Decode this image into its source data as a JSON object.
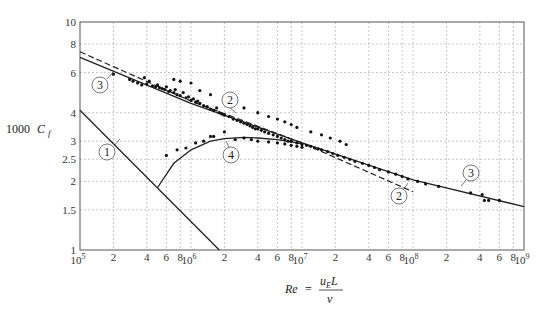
{
  "chart_data": {
    "type": "line",
    "title": "",
    "xlabel": "Re = u_E L / ν",
    "ylabel": "1000 C_f",
    "xscale": "log",
    "yscale": "log",
    "xlim": [
      100000,
      1000000000
    ],
    "ylim": [
      1,
      10
    ],
    "grid": true,
    "x_ticks": [
      {
        "value": 100000,
        "label": "10",
        "exp": "5"
      },
      {
        "value": 200000,
        "label": "2"
      },
      {
        "value": 400000,
        "label": "4"
      },
      {
        "value": 600000,
        "label": "6"
      },
      {
        "value": 800000,
        "label": "8"
      },
      {
        "value": 1000000,
        "label": "10",
        "exp": "6"
      },
      {
        "value": 2000000,
        "label": "2"
      },
      {
        "value": 4000000,
        "label": "4"
      },
      {
        "value": 6000000,
        "label": "6"
      },
      {
        "value": 8000000,
        "label": "8"
      },
      {
        "value": 10000000,
        "label": "10",
        "exp": "7"
      },
      {
        "value": 20000000,
        "label": "2"
      },
      {
        "value": 40000000,
        "label": "4"
      },
      {
        "value": 60000000,
        "label": "6"
      },
      {
        "value": 80000000,
        "label": "8"
      },
      {
        "value": 100000000,
        "label": "10",
        "exp": "8"
      },
      {
        "value": 200000000,
        "label": "2"
      },
      {
        "value": 400000000,
        "label": "4"
      },
      {
        "value": 600000000,
        "label": "6"
      },
      {
        "value": 800000000,
        "label": "8"
      },
      {
        "value": 1000000000,
        "label": "10",
        "exp": "9"
      }
    ],
    "y_ticks": [
      {
        "value": 1,
        "label": "1"
      },
      {
        "value": 1.5,
        "label": "1.5"
      },
      {
        "value": 2,
        "label": "2"
      },
      {
        "value": 2.5,
        "label": "2.5"
      },
      {
        "value": 3,
        "label": "3"
      },
      {
        "value": 4,
        "label": "4"
      },
      {
        "value": 6,
        "label": "6"
      },
      {
        "value": 8,
        "label": "8"
      },
      {
        "value": 10,
        "label": "10"
      }
    ],
    "series": [
      {
        "name": "1",
        "style": "solid",
        "description": "laminar friction line",
        "x": [
          100000,
          1800000
        ],
        "y": [
          4.1,
          1.0
        ]
      },
      {
        "name": "2",
        "style": "dashed",
        "description": "turbulent correlation (dashed)",
        "x": [
          100000,
          1000000,
          10000000,
          100000000
        ],
        "y": [
          7.4,
          4.5,
          2.95,
          1.8
        ]
      },
      {
        "name": "3",
        "style": "solid",
        "description": "turbulent correlation (solid)",
        "x": [
          100000,
          1000000,
          10000000,
          100000000,
          1000000000
        ],
        "y": [
          7.0,
          4.4,
          2.95,
          2.03,
          1.55
        ]
      },
      {
        "name": "4",
        "style": "solid",
        "description": "transition curve",
        "x": [
          500000,
          700000,
          1000000,
          1500000,
          2000000,
          3000000,
          4000000,
          6000000,
          8000000,
          10000000
        ],
        "y": [
          1.88,
          2.4,
          2.75,
          3.0,
          3.08,
          3.12,
          3.1,
          3.05,
          2.98,
          2.92
        ]
      }
    ],
    "scatter": {
      "name": "measurements",
      "points": [
        [
          200000,
          5.9
        ],
        [
          280000,
          5.6
        ],
        [
          300000,
          5.5
        ],
        [
          330000,
          5.4
        ],
        [
          360000,
          5.3
        ],
        [
          380000,
          5.7
        ],
        [
          400000,
          5.35
        ],
        [
          420000,
          5.5
        ],
        [
          450000,
          5.25
        ],
        [
          480000,
          5.2
        ],
        [
          500000,
          5.3
        ],
        [
          520000,
          5.15
        ],
        [
          550000,
          5.1
        ],
        [
          580000,
          5.05
        ],
        [
          600000,
          5.2
        ],
        [
          630000,
          4.95
        ],
        [
          650000,
          5.0
        ],
        [
          700000,
          4.9
        ],
        [
          720000,
          5.05
        ],
        [
          750000,
          4.8
        ],
        [
          800000,
          4.75
        ],
        [
          850000,
          4.9
        ],
        [
          900000,
          4.65
        ],
        [
          950000,
          4.7
        ],
        [
          1000000,
          4.55
        ],
        [
          1050000,
          4.6
        ],
        [
          1100000,
          4.45
        ],
        [
          1150000,
          4.5
        ],
        [
          1200000,
          4.4
        ],
        [
          1300000,
          4.3
        ],
        [
          1400000,
          4.25
        ],
        [
          1500000,
          4.15
        ],
        [
          1600000,
          4.1
        ],
        [
          1700000,
          4.2
        ],
        [
          1800000,
          4.0
        ],
        [
          1900000,
          3.95
        ],
        [
          2000000,
          3.9
        ],
        [
          2200000,
          3.85
        ],
        [
          2400000,
          3.75
        ],
        [
          2600000,
          3.7
        ],
        [
          2800000,
          3.65
        ],
        [
          3000000,
          3.6
        ],
        [
          3200000,
          3.55
        ],
        [
          3400000,
          3.5
        ],
        [
          3600000,
          3.45
        ],
        [
          3800000,
          3.4
        ],
        [
          4000000,
          3.4
        ],
        [
          4300000,
          3.35
        ],
        [
          4600000,
          3.3
        ],
        [
          5000000,
          3.25
        ],
        [
          5500000,
          3.2
        ],
        [
          6000000,
          3.15
        ],
        [
          6500000,
          3.1
        ],
        [
          7000000,
          3.05
        ],
        [
          7500000,
          3.0
        ],
        [
          8000000,
          3.0
        ],
        [
          9000000,
          2.95
        ],
        [
          10000000,
          2.9
        ],
        [
          11000000,
          2.88
        ],
        [
          12000000,
          2.85
        ],
        [
          13000000,
          2.8
        ],
        [
          14000000,
          2.78
        ],
        [
          15000000,
          2.75
        ],
        [
          17000000,
          2.7
        ],
        [
          19000000,
          2.65
        ],
        [
          21000000,
          2.6
        ],
        [
          24000000,
          2.55
        ],
        [
          27000000,
          2.5
        ],
        [
          30000000,
          2.45
        ],
        [
          35000000,
          2.4
        ],
        [
          40000000,
          2.35
        ],
        [
          45000000,
          2.3
        ],
        [
          50000000,
          2.25
        ],
        [
          60000000,
          2.2
        ],
        [
          70000000,
          2.15
        ],
        [
          80000000,
          2.1
        ],
        [
          90000000,
          2.05
        ],
        [
          110000000,
          2.0
        ],
        [
          130000000,
          1.95
        ],
        [
          170000000,
          1.9
        ],
        [
          330000000,
          1.78
        ],
        [
          420000000,
          1.75
        ],
        [
          440000000,
          1.65
        ],
        [
          480000000,
          1.65
        ],
        [
          600000000,
          1.65
        ],
        [
          600000,
          2.6
        ],
        [
          750000,
          2.75
        ],
        [
          900000,
          2.8
        ],
        [
          1100000,
          2.95
        ],
        [
          1300000,
          3.0
        ],
        [
          1500000,
          3.15
        ],
        [
          1600000,
          3.15
        ],
        [
          2000000,
          3.3
        ],
        [
          2500000,
          3.05
        ],
        [
          3000000,
          3.1
        ],
        [
          3500000,
          3.05
        ],
        [
          4000000,
          3.0
        ],
        [
          5000000,
          2.98
        ],
        [
          6000000,
          2.95
        ],
        [
          7000000,
          2.92
        ],
        [
          8000000,
          2.88
        ],
        [
          9000000,
          2.85
        ],
        [
          10000000,
          2.82
        ],
        [
          700000,
          5.6
        ],
        [
          800000,
          5.5
        ],
        [
          1000000,
          5.4
        ],
        [
          1200000,
          5.0
        ],
        [
          1500000,
          4.8
        ],
        [
          2000000,
          4.6
        ],
        [
          2500000,
          4.4
        ],
        [
          3000000,
          4.2
        ],
        [
          4000000,
          4.0
        ],
        [
          5000000,
          3.85
        ],
        [
          6000000,
          3.75
        ],
        [
          7000000,
          3.65
        ],
        [
          8000000,
          3.55
        ],
        [
          9000000,
          3.45
        ],
        [
          12000000,
          3.3
        ],
        [
          15000000,
          3.2
        ],
        [
          18000000,
          3.1
        ],
        [
          22000000,
          3.0
        ],
        [
          25000000,
          2.9
        ]
      ]
    },
    "annotations": [
      {
        "label": "1",
        "cx": 107,
        "cy": 152,
        "lx1": 114,
        "ly1": 146,
        "lx2": 120,
        "ly2": 139
      },
      {
        "label": "2",
        "cx": 230,
        "cy": 100,
        "lx1": 230,
        "ly1": 108,
        "lx2": 236,
        "ly2": 113
      },
      {
        "label": "3",
        "cx": 100,
        "cy": 85,
        "lx1": 107,
        "ly1": 79,
        "lx2": 113,
        "ly2": 72
      },
      {
        "label": "4",
        "cx": 231,
        "cy": 155,
        "lx1": 229,
        "ly1": 147,
        "lx2": 226,
        "ly2": 141
      },
      {
        "label": "2",
        "cx": 399,
        "cy": 196,
        "lx1": 404,
        "ly1": 189,
        "lx2": 408,
        "ly2": 183
      },
      {
        "label": "3",
        "cx": 471,
        "cy": 173,
        "lx1": 466,
        "ly1": 180,
        "lx2": 461,
        "ly2": 186
      }
    ]
  },
  "axis": {
    "ylabel_text": "1000",
    "ylabel_sym": "C",
    "ylabel_sub": "f",
    "xlabel_lhs": "Re",
    "xlabel_eq": "=",
    "xlabel_num": "u",
    "xlabel_num_sub": "E",
    "xlabel_num_L": "L",
    "xlabel_den": "ν"
  }
}
